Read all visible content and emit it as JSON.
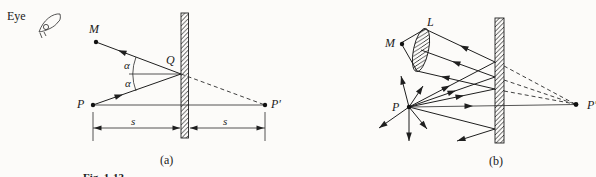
{
  "figure": {
    "eye_label": "Eye",
    "caption": "Fig. 1-13",
    "panel_a": {
      "label": "(a)",
      "point_m": "M",
      "point_q": "Q",
      "point_p": "P",
      "point_p_image": "P′",
      "angle_upper": "α",
      "angle_lower": "α",
      "dist_left": "s",
      "dist_right": "s"
    },
    "panel_b": {
      "label": "(b)",
      "point_l": "L",
      "point_m": "M",
      "point_p": "P",
      "point_p_image": "P′"
    }
  },
  "colors": {
    "ink": "#1f1f1f",
    "background": "#fcfbf9"
  }
}
